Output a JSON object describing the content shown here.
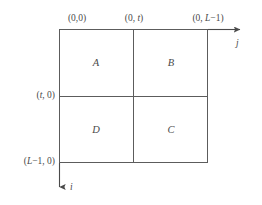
{
  "diagram": {
    "background_color": "#ffffff",
    "line_color": "#5c5c5c",
    "text_color": "#4a4a4a",
    "corner_labels": {
      "top_left": "(0,0)",
      "top_middle": "(0, t)",
      "top_right": "(0, L−1)",
      "left_middle": "(t, 0)",
      "left_bottom": "(L−1, 0)"
    },
    "axes": [
      {
        "name": "j",
        "label": "j",
        "direction": "right",
        "description": "horizontal column axis"
      },
      {
        "name": "i",
        "label": "i",
        "direction": "down",
        "description": "vertical row axis"
      }
    ],
    "quadrants": [
      {
        "id": "A",
        "label": "A",
        "position": "top-left"
      },
      {
        "id": "B",
        "label": "B",
        "position": "top-right"
      },
      {
        "id": "D",
        "label": "D",
        "position": "bottom-left"
      },
      {
        "id": "C",
        "label": "C",
        "position": "bottom-right"
      }
    ]
  }
}
